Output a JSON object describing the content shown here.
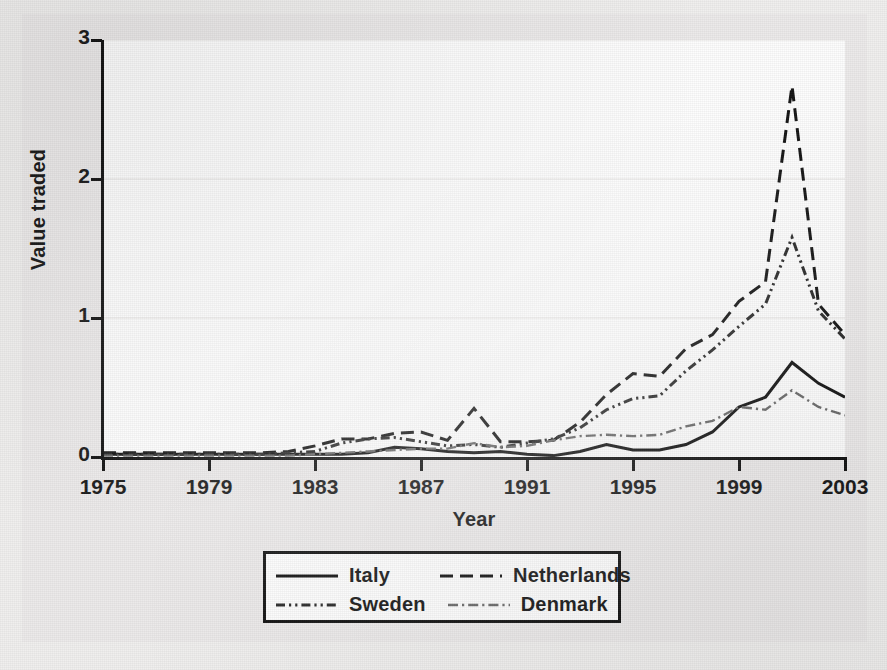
{
  "chart_data": {
    "type": "line",
    "title": "",
    "xlabel": "Year",
    "ylabel": "Value traded",
    "xlim": [
      1975,
      2003
    ],
    "ylim": [
      0,
      3
    ],
    "xticks": [
      "1975",
      "1979",
      "1983",
      "1987",
      "1991",
      "1995",
      "1999",
      "2003"
    ],
    "yticks": [
      "0",
      "1",
      "2",
      "3"
    ],
    "grid": "horizontal-faint",
    "legend_position": "below-center",
    "x": [
      1975,
      1976,
      1977,
      1978,
      1979,
      1980,
      1981,
      1982,
      1983,
      1984,
      1985,
      1986,
      1987,
      1988,
      1989,
      1990,
      1991,
      1992,
      1993,
      1994,
      1995,
      1996,
      1997,
      1998,
      1999,
      2000,
      2001,
      2002,
      2003
    ],
    "series": [
      {
        "name": "Italy",
        "style": "solid",
        "color": "#141414",
        "values": [
          0.02,
          0.02,
          0.02,
          0.02,
          0.02,
          0.02,
          0.02,
          0.02,
          0.02,
          0.02,
          0.03,
          0.07,
          0.06,
          0.04,
          0.03,
          0.04,
          0.02,
          0.01,
          0.04,
          0.09,
          0.05,
          0.05,
          0.09,
          0.18,
          0.36,
          0.43,
          0.68,
          0.53,
          0.43
        ]
      },
      {
        "name": "Netherlands",
        "style": "dashed",
        "color": "#141414",
        "values": [
          0.03,
          0.03,
          0.03,
          0.03,
          0.03,
          0.03,
          0.03,
          0.04,
          0.08,
          0.13,
          0.13,
          0.17,
          0.18,
          0.12,
          0.35,
          0.11,
          0.11,
          0.12,
          0.25,
          0.45,
          0.6,
          0.58,
          0.78,
          0.88,
          1.12,
          1.26,
          2.67,
          1.1,
          0.88
        ]
      },
      {
        "name": "Sweden",
        "style": "dash-dot-dot",
        "color": "#2a2a2a",
        "values": [
          0.02,
          0.02,
          0.02,
          0.02,
          0.02,
          0.02,
          0.02,
          0.03,
          0.04,
          0.1,
          0.13,
          0.14,
          0.11,
          0.08,
          0.09,
          0.07,
          0.1,
          0.13,
          0.21,
          0.34,
          0.42,
          0.44,
          0.62,
          0.77,
          0.94,
          1.1,
          1.58,
          1.05,
          0.85
        ]
      },
      {
        "name": "Denmark",
        "style": "dash-dot",
        "color": "#6a6a6a",
        "values": [
          0.01,
          0.01,
          0.01,
          0.01,
          0.01,
          0.01,
          0.01,
          0.01,
          0.02,
          0.03,
          0.04,
          0.05,
          0.06,
          0.06,
          0.1,
          0.07,
          0.08,
          0.12,
          0.15,
          0.16,
          0.15,
          0.16,
          0.22,
          0.26,
          0.36,
          0.34,
          0.48,
          0.36,
          0.3
        ]
      }
    ]
  },
  "legend": {
    "entries": [
      {
        "label": "Italy",
        "style": "solid"
      },
      {
        "label": "Netherlands",
        "style": "dashed"
      },
      {
        "label": "Sweden",
        "style": "dash-dot-dot"
      },
      {
        "label": "Denmark",
        "style": "dash-dot"
      }
    ]
  }
}
